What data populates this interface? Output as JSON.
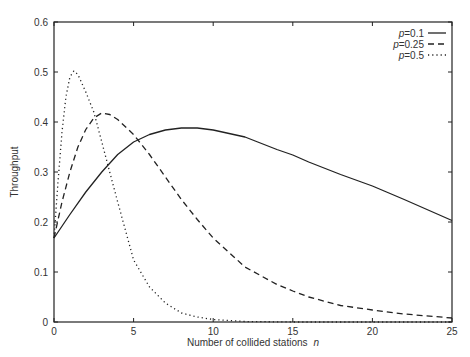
{
  "chart_data": {
    "type": "line",
    "title": "",
    "xlabel": "Number of collided stations",
    "xlabel_var": "n",
    "ylabel": "Throughput",
    "xlim": [
      0,
      25
    ],
    "ylim": [
      0,
      0.6
    ],
    "xticks": [
      0,
      5,
      10,
      15,
      20,
      25
    ],
    "yticks": [
      0,
      0.1,
      0.2,
      0.3,
      0.4,
      0.5,
      0.6
    ],
    "xtick_labels": [
      "0",
      "5",
      "10",
      "15",
      "20",
      "25"
    ],
    "ytick_labels": [
      "0",
      "0.1",
      "0.2",
      "0.3",
      "0.4",
      "0.5",
      "0.6"
    ],
    "grid": false,
    "legend_position": "upper right",
    "series": [
      {
        "name": "p=0.1",
        "legend_var": "p",
        "legend_value": "=0.1",
        "style": "solid",
        "x": [
          0,
          1,
          2,
          2.5,
          3,
          4,
          5,
          6,
          7,
          8,
          9,
          10,
          12,
          14,
          15,
          16,
          18,
          20,
          22,
          25
        ],
        "y": [
          0.168,
          0.215,
          0.26,
          0.28,
          0.3,
          0.335,
          0.36,
          0.375,
          0.384,
          0.388,
          0.388,
          0.384,
          0.37,
          0.345,
          0.334,
          0.32,
          0.295,
          0.272,
          0.245,
          0.203
        ]
      },
      {
        "name": "p=0.25",
        "legend_var": "p",
        "legend_value": "=0.25",
        "style": "dashed",
        "x": [
          0,
          0.5,
          1,
          1.5,
          2,
          2.5,
          3,
          3.5,
          4,
          5,
          6,
          7,
          8,
          9,
          10,
          12,
          14,
          15,
          16,
          18,
          20,
          22,
          25
        ],
        "y": [
          0.168,
          0.24,
          0.3,
          0.35,
          0.385,
          0.408,
          0.418,
          0.415,
          0.405,
          0.375,
          0.335,
          0.29,
          0.245,
          0.205,
          0.168,
          0.11,
          0.075,
          0.062,
          0.05,
          0.033,
          0.024,
          0.016,
          0.008
        ]
      },
      {
        "name": "p=0.5",
        "legend_var": "p",
        "legend_value": "=0.5",
        "style": "dotted",
        "x": [
          0,
          0.25,
          0.5,
          0.75,
          1,
          1.25,
          1.5,
          2,
          2.5,
          3,
          3.5,
          4,
          5,
          6,
          7,
          8,
          9,
          10,
          12,
          15,
          20,
          25
        ],
        "y": [
          0.168,
          0.28,
          0.38,
          0.45,
          0.49,
          0.502,
          0.495,
          0.46,
          0.42,
          0.36,
          0.3,
          0.24,
          0.124,
          0.07,
          0.038,
          0.018,
          0.01,
          0.005,
          0.001,
          0,
          0,
          0
        ]
      }
    ]
  }
}
